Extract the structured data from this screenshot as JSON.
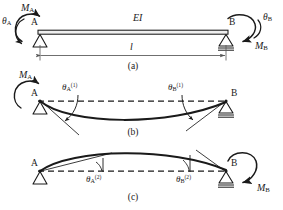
{
  "figure": {
    "stroke_color": "#1a1a1a",
    "beam_color": "#1a1a1a",
    "dash_color": "#1a1a1a",
    "background": "#ffffff"
  },
  "panel_a": {
    "caption": "(a)",
    "node_a_label": "A",
    "node_b_label": "B",
    "beam_label": "EI",
    "span_label": "l",
    "moment_a_label": "M",
    "moment_a_sub": "A",
    "moment_b_label": "M",
    "moment_b_sub": "B",
    "theta_a_label": "θ",
    "theta_a_sub": "A",
    "theta_b_label": "θ",
    "theta_b_sub": "B",
    "support_a_type": "pin-triangle",
    "support_b_type": "roller-triangle"
  },
  "panel_b": {
    "caption": "(b)",
    "node_a_label": "A",
    "node_b_label": "B",
    "moment_a_label": "M",
    "moment_a_sub": "A",
    "theta_a_label": "θ",
    "theta_a_sub": "A",
    "theta_a_sup": "(1)",
    "theta_b_label": "θ",
    "theta_b_sub": "B",
    "theta_b_sup": "(1)",
    "deflection_shape": "sagging"
  },
  "panel_c": {
    "caption": "(c)",
    "node_a_label": "A",
    "node_b_label": "B",
    "moment_b_label": "M",
    "moment_b_sub": "B",
    "theta_a_label": "θ",
    "theta_a_sub": "A",
    "theta_a_sup": "(2)",
    "theta_b_label": "θ",
    "theta_b_sub": "B",
    "theta_b_sup": "(2)",
    "deflection_shape": "hogging"
  }
}
